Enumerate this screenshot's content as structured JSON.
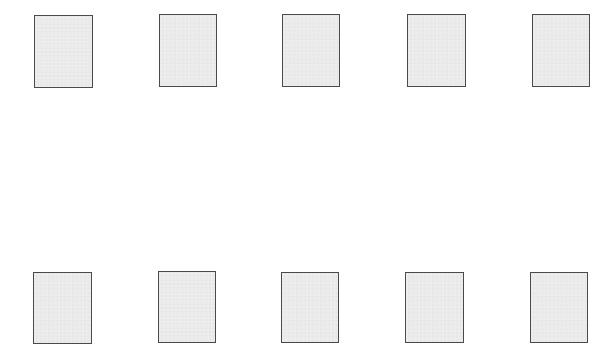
{
  "canvas": {
    "width": 615,
    "height": 350,
    "background": "#ffffff"
  },
  "style": {
    "card_fill": "#ebebeb",
    "card_border": "#4a4a4a"
  },
  "rows": [
    {
      "name": "top-row",
      "cards": [
        {
          "x": 34,
          "y": 15,
          "w": 59,
          "h": 73
        },
        {
          "x": 159,
          "y": 14,
          "w": 58,
          "h": 73
        },
        {
          "x": 282,
          "y": 14,
          "w": 58,
          "h": 73
        },
        {
          "x": 407,
          "y": 14,
          "w": 59,
          "h": 73
        },
        {
          "x": 532,
          "y": 14,
          "w": 58,
          "h": 73
        }
      ]
    },
    {
      "name": "bottom-row",
      "cards": [
        {
          "x": 33,
          "y": 272,
          "w": 59,
          "h": 72
        },
        {
          "x": 158,
          "y": 271,
          "w": 58,
          "h": 72
        },
        {
          "x": 281,
          "y": 272,
          "w": 58,
          "h": 71
        },
        {
          "x": 405,
          "y": 272,
          "w": 59,
          "h": 71
        },
        {
          "x": 530,
          "y": 272,
          "w": 58,
          "h": 71
        }
      ]
    }
  ]
}
